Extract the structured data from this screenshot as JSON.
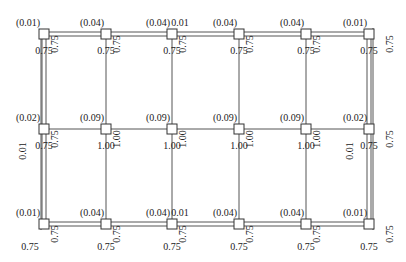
{
  "diagram": {
    "type": "structural-grid",
    "columns_x": [
      44,
      106,
      172,
      239,
      306,
      369
    ],
    "rows_y": [
      34,
      129,
      224
    ],
    "node_size": 10,
    "colors": {
      "line": "#555555",
      "node_stroke": "#333333",
      "node_fill": "#ffffff",
      "text": "#222222",
      "background": "#ffffff"
    },
    "rows": [
      {
        "name": "top",
        "nodes": [
          {
            "above": "(0.01)",
            "below": "0.75",
            "side": "0.75"
          },
          {
            "above": "(0.04)",
            "below": "0.75",
            "side": "0.75"
          },
          {
            "above": "(0.04)",
            "above_extra": "0.01",
            "below": "0.75",
            "side": "0.75"
          },
          {
            "above": "(0.04)",
            "below": "0.75",
            "side": "0.75"
          },
          {
            "above": "(0.04)",
            "below": "0.75",
            "side": "0.75"
          },
          {
            "above": "(0.01)",
            "below": "0.75",
            "side": "0.75"
          }
        ]
      },
      {
        "name": "middle",
        "nodes": [
          {
            "above": "(0.02)",
            "below": "0.75",
            "side": "0.75",
            "left_vertical": "0.01"
          },
          {
            "above": "(0.09)",
            "below": "1.00",
            "side": "1.00"
          },
          {
            "above": "(0.09)",
            "below": "1.00",
            "side": "1.00"
          },
          {
            "above": "(0.09)",
            "below": "1.00",
            "side": "1.00"
          },
          {
            "above": "(0.09)",
            "below": "1.00",
            "side": "1.00"
          },
          {
            "above": "(0.02)",
            "below": "0.75",
            "side": "0.75",
            "left_vertical": "0.01"
          }
        ]
      },
      {
        "name": "bottom",
        "nodes": [
          {
            "above": "(0.01)",
            "below": "0.75",
            "side": "0.75"
          },
          {
            "above": "(0.04)",
            "below": "0.75",
            "side": "0.75"
          },
          {
            "above": "(0.04)",
            "above_extra": "0.01",
            "below": "0.75",
            "side": "0.75"
          },
          {
            "above": "(0.04)",
            "below": "0.75",
            "side": "0.75"
          },
          {
            "above": "(0.04)",
            "below": "0.75",
            "side": "0.75"
          },
          {
            "above": "(0.01)",
            "below": "0.75",
            "side": "0.75"
          }
        ]
      }
    ]
  }
}
